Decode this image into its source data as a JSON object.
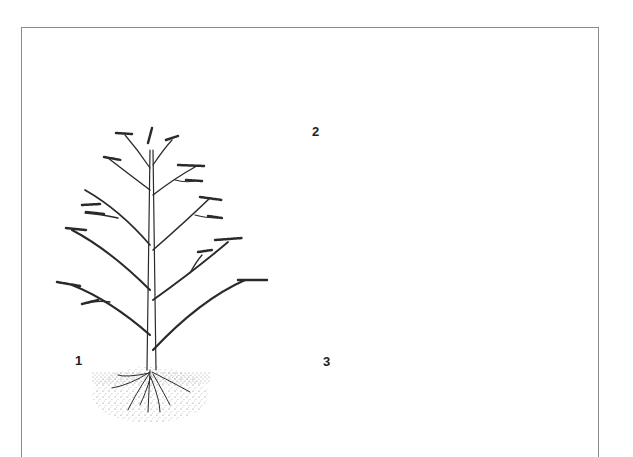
{
  "figure": {
    "panels": [
      {
        "label": "1",
        "subject": "young tree with lateral branches and roots"
      },
      {
        "label": "2",
        "subject": "stem laid horizontally and pegged down, shoots growing upward"
      },
      {
        "label": "3",
        "subject": "upright shoots rooted along the buried stem"
      }
    ]
  },
  "colors": {
    "ink": "#2a2a2a",
    "frame": "#8a8a8a",
    "soil": "#9a9a9a"
  }
}
